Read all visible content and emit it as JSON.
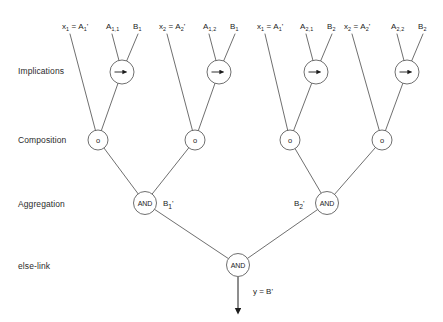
{
  "diagram": {
    "line_color": "#4a4a4a",
    "text_color": "#1c1c1c",
    "background": "#ffffff"
  },
  "row_labels": [
    {
      "id": "implications",
      "label": "Implications",
      "x": 18,
      "y": 66
    },
    {
      "id": "composition",
      "label": "Composition",
      "x": 18,
      "y": 135
    },
    {
      "id": "aggregation",
      "label": "Aggregation",
      "x": 18,
      "y": 199
    },
    {
      "id": "else-link",
      "label": "else-link",
      "x": 18,
      "y": 261
    }
  ],
  "groups": [
    {
      "id": "group-1",
      "input_label": "x₁ = A₁'",
      "input_base": "x",
      "input_sub": "1",
      "input_rhs": "A",
      "input_rhs_sub": "1",
      "antecedent_label": "A₁,₁",
      "antecedent_base": "A",
      "antecedent_sub": "1,1",
      "consequent_label": "B₁",
      "consequent_base": "B",
      "consequent_sub": "1",
      "input_x": 62,
      "input_y": 22,
      "ant_x": 106,
      "ant_y": 22,
      "cons_x": 133,
      "cons_y": 22,
      "impl_cx": 122,
      "impl_cy": 72,
      "comp_cx": 98,
      "comp_cy": 140,
      "impl_symbol": "→",
      "comp_symbol": "o"
    },
    {
      "id": "group-2",
      "input_label": "x₂ = A₂'",
      "input_base": "x",
      "input_sub": "2",
      "input_rhs": "A",
      "input_rhs_sub": "2",
      "antecedent_label": "A₁,₂",
      "antecedent_base": "A",
      "antecedent_sub": "1,2",
      "consequent_label": "B₁",
      "consequent_base": "B",
      "consequent_sub": "1",
      "input_x": 159,
      "input_y": 22,
      "ant_x": 203,
      "ant_y": 22,
      "cons_x": 230,
      "cons_y": 22,
      "impl_cx": 219,
      "impl_cy": 72,
      "comp_cx": 195,
      "comp_cy": 140,
      "impl_symbol": "→",
      "comp_symbol": "o"
    },
    {
      "id": "group-3",
      "input_label": "x₁ =A₁'",
      "input_base": "x",
      "input_sub": "1",
      "input_rhs": "A",
      "input_rhs_sub": "1",
      "antecedent_label": "A₂,₁",
      "antecedent_base": "A",
      "antecedent_sub": "2,1",
      "consequent_label": "B₂",
      "consequent_base": "B",
      "consequent_sub": "2",
      "input_x": 257,
      "input_y": 22,
      "ant_x": 300,
      "ant_y": 22,
      "cons_x": 327,
      "cons_y": 22,
      "impl_cx": 316,
      "impl_cy": 72,
      "comp_cx": 290,
      "comp_cy": 140,
      "impl_symbol": "→",
      "comp_symbol": "o"
    },
    {
      "id": "group-4",
      "input_label": "x₂ = A₂'",
      "input_base": "x",
      "input_sub": "2",
      "input_rhs": "A",
      "input_rhs_sub": "2",
      "antecedent_label": "A₂,₂",
      "antecedent_base": "A",
      "antecedent_sub": "2,2",
      "consequent_label": "B₂",
      "consequent_base": "B",
      "consequent_sub": "2",
      "input_x": 344,
      "input_y": 22,
      "ant_x": 391,
      "ant_y": 22,
      "cons_x": 418,
      "cons_y": 22,
      "impl_cx": 407,
      "impl_cy": 72,
      "comp_cx": 382,
      "comp_cy": 140,
      "impl_symbol": "→",
      "comp_symbol": "o"
    }
  ],
  "aggregation_nodes": [
    {
      "id": "and-left",
      "label": "AND",
      "cx": 145,
      "cy": 203,
      "side_label": "B₁'",
      "side_base": "B",
      "side_sub": "1",
      "side_x": 163,
      "side_y": 199
    },
    {
      "id": "and-right",
      "label": "AND",
      "cx": 327,
      "cy": 203,
      "side_label": "B₂'",
      "side_base": "B",
      "side_sub": "2",
      "side_x": 294,
      "side_y": 199
    }
  ],
  "else_link_node": {
    "id": "and-bottom",
    "label": "AND",
    "cx": 238,
    "cy": 265
  },
  "output": {
    "label": "y = B'",
    "x": 253,
    "y": 287,
    "arrow_from_y": 277,
    "arrow_to_y": 311
  },
  "node_radius": {
    "implication": 12,
    "composition": 10,
    "and": 11.5
  }
}
